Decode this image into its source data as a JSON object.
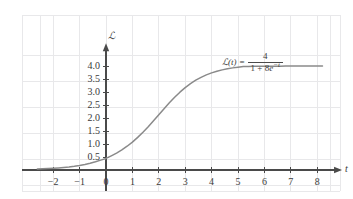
{
  "chart_data": {
    "type": "line",
    "title": "",
    "xlabel": "t",
    "ylabel": "N",
    "equation_text": "N(t) = 4 / (1 + 8e^-t)",
    "equation_parts": {
      "lhs": "ℒ(t)",
      "lhs_plain": "N(t)",
      "equals": "=",
      "numerator": "4",
      "denominator_prefix": "1 + 8",
      "denominator_base": "e",
      "denominator_exponent": "−t"
    },
    "formula": {
      "carrying_capacity": 4,
      "coefficient": 8,
      "rate": 1
    },
    "xlim": [
      -2.6,
      8.6
    ],
    "ylim": [
      -0.35,
      4.45
    ],
    "grid": true,
    "legend": false,
    "x_ticks": [
      -2,
      -1,
      0,
      1,
      2,
      3,
      4,
      5,
      6,
      7,
      8
    ],
    "x_tick_labels": [
      "−2",
      "−1",
      "0",
      "1",
      "2",
      "3",
      "4",
      "5",
      "6",
      "7",
      "8"
    ],
    "y_ticks": [
      0.5,
      1.0,
      1.5,
      2.0,
      2.5,
      3.0,
      3.5,
      4.0
    ],
    "y_tick_labels": [
      "0.5",
      "1.0",
      "1.5",
      "2.0",
      "2.5",
      "3.0",
      "3.5",
      "4.0"
    ],
    "asymptote": 4.0,
    "x": [
      -2.6,
      -2.4,
      -2.2,
      -2.0,
      -1.8,
      -1.6,
      -1.4,
      -1.2,
      -1.0,
      -0.8,
      -0.6,
      -0.4,
      -0.2,
      0.0,
      0.2,
      0.4,
      0.6,
      0.8,
      1.0,
      1.2,
      1.4,
      1.6,
      1.8,
      2.0,
      2.2,
      2.4,
      2.6,
      2.8,
      3.0,
      3.2,
      3.4,
      3.6,
      3.8,
      4.0,
      4.2,
      4.4,
      4.6,
      4.8,
      5.0,
      5.2,
      5.4,
      5.6,
      5.8,
      6.0,
      6.2,
      6.4,
      6.6,
      6.8,
      7.0,
      7.2,
      7.4,
      7.6,
      7.8,
      8.0,
      8.2
    ],
    "y": [
      0.0366,
      0.0446,
      0.0544,
      0.0663,
      0.0808,
      0.0984,
      0.1198,
      0.1457,
      0.1771,
      0.215,
      0.2605,
      0.315,
      0.38,
      0.4444,
      0.5455,
      0.6506,
      0.7729,
      0.9139,
      1.0744,
      1.2545,
      1.4531,
      1.6675,
      1.8936,
      2.1259,
      2.3581,
      2.5838,
      2.797,
      2.993,
      3.1684,
      3.3218,
      3.4535,
      3.5649,
      3.6582,
      3.7355,
      3.7992,
      3.8513,
      3.8937,
      3.9281,
      3.9559,
      3.9783,
      3.9823,
      3.9856,
      3.9883,
      3.9905,
      3.9922,
      3.9936,
      3.9948,
      3.9957,
      3.9965,
      3.9971,
      3.9976,
      3.998,
      3.9984,
      3.9987,
      3.9989
    ]
  },
  "axes": {
    "y_axis_name": "ℒ",
    "x_axis_name": "t"
  },
  "colors": {
    "curve": "#8a8a8a",
    "axis": "#4a4a4a",
    "grid": "#e8e8ea",
    "text": "#3a3a3a",
    "background": "#ffffff"
  }
}
